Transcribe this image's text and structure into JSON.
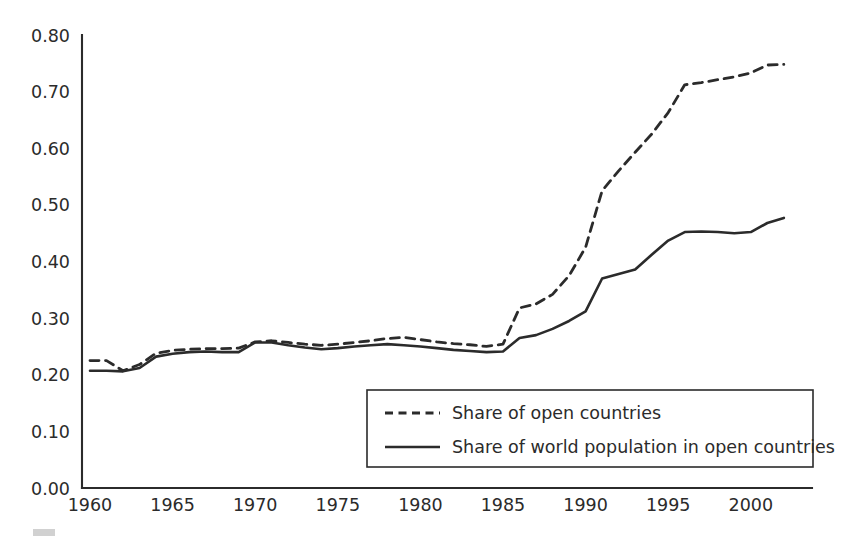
{
  "chart_data": {
    "type": "line",
    "title": "",
    "subtitle": "",
    "xlabel": "",
    "ylabel": "",
    "xlim": [
      1960,
      2002
    ],
    "ylim": [
      0.0,
      0.8
    ],
    "grid": false,
    "legend_position": "bottom-right",
    "x_tick_labels": [
      "1960",
      "1965",
      "1970",
      "1975",
      "1980",
      "1985",
      "1990",
      "1995",
      "2000"
    ],
    "x_ticks": [
      1960,
      1965,
      1970,
      1975,
      1980,
      1985,
      1990,
      1995,
      2000
    ],
    "y_tick_labels": [
      "0.00",
      "0.10",
      "0.20",
      "0.30",
      "0.40",
      "0.50",
      "0.60",
      "0.70",
      "0.80"
    ],
    "y_ticks": [
      0.0,
      0.1,
      0.2,
      0.3,
      0.4,
      0.5,
      0.6,
      0.7,
      0.8
    ],
    "x": [
      1960,
      1961,
      1962,
      1963,
      1964,
      1965,
      1966,
      1967,
      1968,
      1969,
      1970,
      1971,
      1972,
      1973,
      1974,
      1975,
      1976,
      1977,
      1978,
      1979,
      1980,
      1981,
      1982,
      1983,
      1984,
      1985,
      1986,
      1987,
      1988,
      1989,
      1990,
      1991,
      1992,
      1993,
      1994,
      1995,
      1996,
      1997,
      1998,
      1999,
      2000,
      2001,
      2002
    ],
    "series": [
      {
        "name": "Share of open countries",
        "style": "dashed",
        "color": "#2b2b2b",
        "values": [
          0.225,
          0.225,
          0.207,
          0.218,
          0.238,
          0.243,
          0.245,
          0.246,
          0.246,
          0.247,
          0.258,
          0.26,
          0.257,
          0.254,
          0.252,
          0.254,
          0.257,
          0.26,
          0.264,
          0.266,
          0.262,
          0.258,
          0.255,
          0.253,
          0.25,
          0.254,
          0.318,
          0.325,
          0.342,
          0.375,
          0.425,
          0.525,
          0.56,
          0.593,
          0.625,
          0.663,
          0.712,
          0.716,
          0.721,
          0.726,
          0.733,
          0.747,
          0.748
        ]
      },
      {
        "name": "Share of world population in open countries",
        "style": "solid",
        "color": "#2b2b2b",
        "values": [
          0.207,
          0.207,
          0.206,
          0.212,
          0.232,
          0.237,
          0.24,
          0.241,
          0.24,
          0.24,
          0.257,
          0.257,
          0.252,
          0.248,
          0.245,
          0.247,
          0.25,
          0.252,
          0.254,
          0.252,
          0.25,
          0.247,
          0.244,
          0.242,
          0.24,
          0.241,
          0.265,
          0.27,
          0.281,
          0.295,
          0.312,
          0.37,
          0.378,
          0.386,
          0.412,
          0.437,
          0.452,
          0.453,
          0.452,
          0.45,
          0.452,
          0.468,
          0.477
        ]
      }
    ],
    "legend_entries": [
      {
        "label": "Share of open countries",
        "style": "dashed"
      },
      {
        "label": "Share of world population in open countries",
        "style": "solid"
      }
    ]
  },
  "colors": {
    "ink": "#2b2b2b",
    "background": "#ffffff"
  }
}
